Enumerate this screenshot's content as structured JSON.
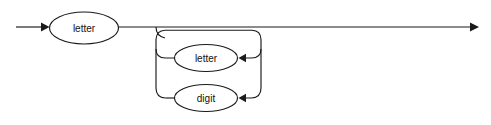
{
  "diagram": {
    "kind": "railroad-syntax-diagram",
    "background_color": "#ffffff",
    "line_color": "#1a1a1a",
    "node_fill_color": "#ffffff",
    "text_color": "#111111",
    "entry_arrow": {
      "name": "entry-arrow",
      "direction": "right",
      "tip_x": 47,
      "y": 27
    },
    "exit_arrow": {
      "name": "exit-arrow",
      "direction": "right",
      "tip_x": 479,
      "y": 27
    },
    "main_line_y": 27,
    "nodes": [
      {
        "id": "first-letter",
        "label": "letter",
        "shape": "ellipse",
        "cx": 84,
        "cy": 28,
        "rx": 34.5,
        "ry": 16
      },
      {
        "id": "loop-letter",
        "label": "letter",
        "shape": "ellipse",
        "cx": 206,
        "cy": 58,
        "rx": 31.5,
        "ry": 13.5
      },
      {
        "id": "loop-digit",
        "label": "digit",
        "shape": "ellipse",
        "cx": 206,
        "cy": 98,
        "rx": 31.5,
        "ry": 13.5
      }
    ],
    "loop": {
      "name": "repetition-loop",
      "left_x": 156,
      "right_x": 261,
      "top_y": 30,
      "letter_branch_y": 58,
      "digit_branch_y": 98,
      "corner_radius": 9,
      "arrow_letter": {
        "name": "loop-letter-arrow",
        "tip_x": 240,
        "y": 58,
        "direction": "left"
      },
      "arrow_digit": {
        "name": "loop-digit-arrow",
        "tip_x": 240,
        "y": 98,
        "direction": "left"
      }
    },
    "notes": {
      "reads_as": "letter followed by zero or more of (letter or digit)"
    }
  }
}
